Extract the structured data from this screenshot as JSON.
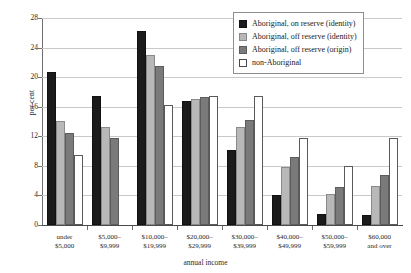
{
  "chart_data": {
    "type": "bar",
    "title": "",
    "subtitle": "",
    "xlabel": "annual income",
    "ylabel": "per cent",
    "ylim": [
      0,
      28
    ],
    "yticks": [
      0,
      4,
      8,
      12,
      16,
      20,
      24,
      28
    ],
    "grid": true,
    "legend_position": "top-right",
    "categories": [
      "under $5,000",
      "$5,000–$9,999",
      "$10,000–$19,999",
      "$20,000–$29,999",
      "$30,000–$39,999",
      "$40,000–$49,999",
      "$50,000–$59,999",
      "$60,000 and over"
    ],
    "category_lines": [
      [
        "under",
        "$5,000"
      ],
      [
        "$5,000–",
        "$9,999"
      ],
      [
        "$10,000–",
        "$19,999"
      ],
      [
        "$20,000–",
        "$29,999"
      ],
      [
        "$30,000–",
        "$39,999"
      ],
      [
        "$40,000–",
        "$49,999"
      ],
      [
        "$50,000–",
        "$59,999"
      ],
      [
        "$60,000",
        "and over"
      ]
    ],
    "series": [
      {
        "name": "Aboriginal, on reserve (identity)",
        "color": "#1b1b1b",
        "values": [
          20.7,
          17.5,
          26.2,
          16.8,
          10.2,
          4.0,
          1.5,
          1.3
        ]
      },
      {
        "name": "Aboriginal, off reserve (identity)",
        "color": "#b8b8b8",
        "values": [
          14.1,
          13.2,
          23.0,
          17.1,
          13.3,
          7.9,
          4.2,
          5.3
        ]
      },
      {
        "name": "Aboriginal, off reserve (origin)",
        "color": "#7a7a7a",
        "values": [
          12.5,
          11.8,
          21.5,
          17.3,
          14.2,
          9.2,
          5.1,
          6.8
        ]
      },
      {
        "name": "non-Aboriginal",
        "color": "#ffffff",
        "values": [
          9.5,
          0.0,
          16.2,
          17.5,
          17.5,
          11.8,
          8.0,
          11.8
        ]
      }
    ]
  }
}
